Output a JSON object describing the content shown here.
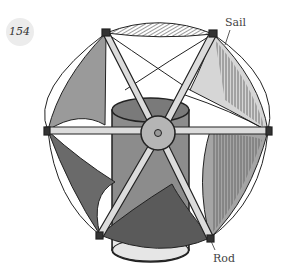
{
  "page": {
    "number": "154"
  },
  "diagram": {
    "labels": {
      "sail": "Sail",
      "rod": "Rod"
    },
    "colors": {
      "ink": "#222222",
      "sail_dark": "#6a6a6a",
      "sail_mid": "#9a9a9a",
      "sail_light": "#d0d0d0",
      "cylinder": "#8c8c8c",
      "hub": "#b5b5b5",
      "rod_fill": "#dcdcdc",
      "badge": "#ececec"
    }
  }
}
